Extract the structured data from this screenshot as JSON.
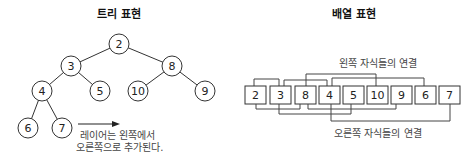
{
  "tree": {
    "title": "트리 표현",
    "nodes": [
      {
        "value": "2",
        "x": 119,
        "y": 44
      },
      {
        "value": "3",
        "x": 71,
        "y": 66
      },
      {
        "value": "8",
        "x": 172,
        "y": 66
      },
      {
        "value": "4",
        "x": 42,
        "y": 91
      },
      {
        "value": "5",
        "x": 100,
        "y": 91
      },
      {
        "value": "10",
        "x": 138,
        "y": 91
      },
      {
        "value": "9",
        "x": 205,
        "y": 91
      },
      {
        "value": "6",
        "x": 28,
        "y": 128
      },
      {
        "value": "7",
        "x": 62,
        "y": 128
      }
    ],
    "caption_line1": "레이어는 왼쪽에서",
    "caption_line2": "오른쪽으로 추가된다."
  },
  "array": {
    "title": "배열 표현",
    "cells": [
      "2",
      "3",
      "8",
      "4",
      "5",
      "10",
      "9",
      "6",
      "7"
    ],
    "left_links_label": "왼쪽 자식들의 연결",
    "right_links_label": "오른쪽 자식들의 연결"
  }
}
